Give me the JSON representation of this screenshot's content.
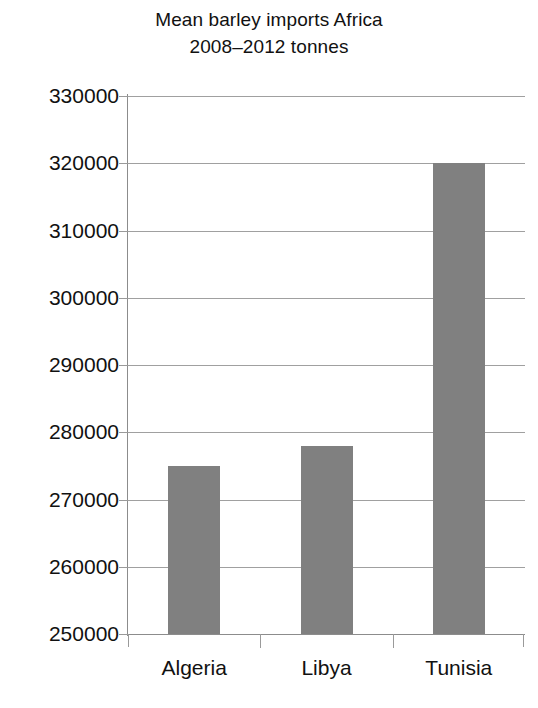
{
  "chart_data": {
    "type": "bar",
    "title": "Mean barley imports Africa 2008–2012 tonnes",
    "title_lines": [
      "Mean barley imports Africa",
      "2008–2012 tonnes"
    ],
    "categories": [
      "Algeria",
      "Libya",
      "Tunisia"
    ],
    "values": [
      275000,
      278000,
      320000
    ],
    "xlabel": "",
    "ylabel": "",
    "ylim": [
      250000,
      330000
    ],
    "ytick_step": 10000,
    "yticks": [
      330000,
      320000,
      310000,
      300000,
      290000,
      280000,
      270000,
      260000,
      250000
    ],
    "ytick_labels": [
      "330000",
      "320000",
      "310000",
      "300000",
      "290000",
      "280000",
      "270000",
      "260000",
      "250000"
    ],
    "grid": true,
    "grid_axis": "y",
    "legend": false,
    "legend_position": "none",
    "bar_color": "#808080",
    "gridline_color": "#a0a0a0",
    "axis_color": "#8c8c8c",
    "background_color": "#ffffff",
    "text_color": "#111111"
  }
}
